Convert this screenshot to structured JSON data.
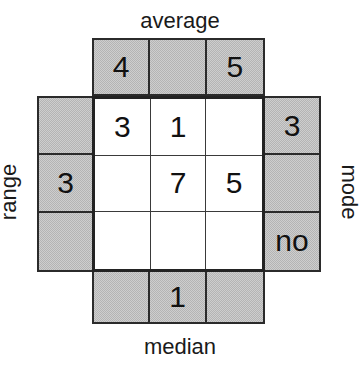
{
  "figure": {
    "title_top": "average",
    "title_bottom": "median",
    "title_left": "range",
    "title_right": "mode",
    "colors": {
      "clue_cell_fill": "#b4b4b4",
      "answer_cell_fill": "#ffffff",
      "grid_line": "#2b2b2b",
      "text": "#111111",
      "background": "#ffffff"
    }
  },
  "arms": {
    "top": {
      "label": "average",
      "cells": [
        {
          "value": "4"
        },
        {
          "value": ""
        },
        {
          "value": "5"
        }
      ]
    },
    "bottom": {
      "label": "median",
      "cells": [
        {
          "value": ""
        },
        {
          "value": "1"
        },
        {
          "value": ""
        }
      ]
    },
    "left": {
      "label": "range",
      "cells": [
        {
          "value": ""
        },
        {
          "value": "3"
        },
        {
          "value": ""
        }
      ]
    },
    "right": {
      "label": "mode",
      "cells": [
        {
          "value": "3"
        },
        {
          "value": ""
        },
        {
          "value": "no"
        }
      ]
    }
  },
  "center_grid": {
    "rows": 3,
    "cols": 3,
    "cells": [
      {
        "value": "3"
      },
      {
        "value": "1"
      },
      {
        "value": ""
      },
      {
        "value": ""
      },
      {
        "value": "7"
      },
      {
        "value": "5"
      },
      {
        "value": ""
      },
      {
        "value": ""
      },
      {
        "value": ""
      }
    ]
  },
  "chart_data": {
    "type": "table",
    "title": "",
    "row_clue_labels": [
      "range",
      "mode"
    ],
    "column_clue_labels": [
      "average",
      "median"
    ],
    "grid": [
      [
        "3",
        "1",
        ""
      ],
      [
        "",
        "7",
        "5"
      ],
      [
        "",
        "",
        ""
      ]
    ],
    "clues": {
      "average_top_row": [
        "4",
        "",
        "5"
      ],
      "median_bottom_row": [
        "",
        "1",
        ""
      ],
      "range_left_column": [
        "",
        "3",
        ""
      ],
      "mode_right_column": [
        "3",
        "",
        "no"
      ]
    }
  }
}
